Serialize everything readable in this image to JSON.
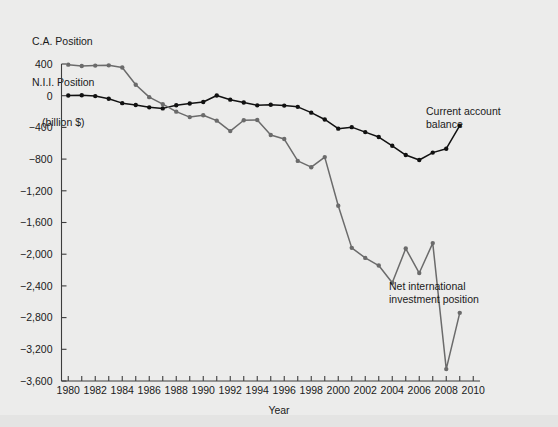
{
  "figure": {
    "title_lines": [
      "C.A. Position",
      "N.I.I. Position",
      "(billion $)"
    ],
    "xlabel": "Year",
    "background_color": "#ececeb",
    "annotations": {
      "current_account": "Current account\nbalance",
      "niip": "Net international\ninvestment position"
    }
  },
  "chart_data": {
    "type": "line",
    "xlabel": "Year",
    "ylabel": "billion $",
    "xlim": [
      1979.5,
      2010.5
    ],
    "ylim": [
      -3600,
      400
    ],
    "grid": false,
    "legend": "annotations-inline",
    "yticks": [
      400,
      0,
      -400,
      -800,
      -1200,
      -1600,
      -2000,
      -2400,
      -2800,
      -3200,
      -3600
    ],
    "ytick_labels": [
      "400",
      "0",
      "−400",
      "−800",
      "−1,200",
      "−1,600",
      "−2,000",
      "−2,400",
      "−2,800",
      "−3,200",
      "−3,600"
    ],
    "xticks": [
      1980,
      1981,
      1982,
      1983,
      1984,
      1985,
      1986,
      1987,
      1988,
      1989,
      1990,
      1991,
      1992,
      1993,
      1994,
      1995,
      1996,
      1997,
      1998,
      1999,
      2000,
      2001,
      2002,
      2003,
      2004,
      2005,
      2006,
      2007,
      2008,
      2009,
      2010
    ],
    "xtick_labels_shown": [
      "1980",
      "1982",
      "1984",
      "1986",
      "1988",
      "1990",
      "1992",
      "1994",
      "1996",
      "1998",
      "2000",
      "2002",
      "2004",
      "2006",
      "2008",
      "2010"
    ],
    "x": [
      1980,
      1981,
      1982,
      1983,
      1984,
      1985,
      1986,
      1987,
      1988,
      1989,
      1990,
      1991,
      1992,
      1993,
      1994,
      1995,
      1996,
      1997,
      1998,
      1999,
      2000,
      2001,
      2002,
      2003,
      2004,
      2005,
      2006,
      2007,
      2008,
      2009
    ],
    "series": [
      {
        "name": "Current account balance",
        "color": "#111111",
        "marker": "circle",
        "values": [
          2,
          5,
          -5,
          -38,
          -94,
          -118,
          -147,
          -160,
          -121,
          -99,
          -79,
          3,
          -50,
          -85,
          -122,
          -114,
          -125,
          -141,
          -214,
          -300,
          -416,
          -397,
          -459,
          -522,
          -632,
          -749,
          -811,
          -718,
          -669,
          -378
        ]
      },
      {
        "name": "Net international investment position",
        "color": "#6b6b6b",
        "marker": "circle",
        "values": [
          392,
          375,
          380,
          383,
          355,
          139,
          -18,
          -106,
          -201,
          -270,
          -247,
          -315,
          -447,
          -310,
          -306,
          -496,
          -547,
          -823,
          -902,
          -775,
          -1389,
          -1920,
          -2047,
          -2143,
          -2360,
          -1929,
          -2238,
          -1860,
          -3450,
          -2740
        ]
      }
    ]
  }
}
